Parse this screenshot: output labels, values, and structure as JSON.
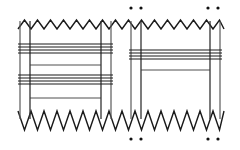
{
  "figure": {
    "background_color": "#ffffff",
    "ink_color": "#1a1a1a",
    "rule_color": "#5a5a5a",
    "width": 240,
    "height": 150
  },
  "chart_data": {
    "type": "diagram",
    "description": "Two rectangular panels with sawtooth (zigzag) torn top and bottom edges, vertical selvedge rules, grouped horizontal weft lines, and four pairs of registration dots above and below the right panel.",
    "xlabel": "",
    "ylabel": "",
    "grid": false,
    "legend": "none",
    "panels": [
      {
        "name": "left-panel",
        "x_start": 18,
        "x_end": 113,
        "y_top": 27,
        "y_bottom": 113,
        "vertical_rules": [
          20,
          30,
          101,
          111
        ],
        "horizontal_line_groups": [
          {
            "name": "group-1",
            "y_values": [
              44,
              47,
              50,
              53
            ],
            "x_start": 18,
            "x_end": 113
          },
          {
            "name": "group-2",
            "y_values": [
              65
            ],
            "x_start": 30,
            "x_end": 101
          },
          {
            "name": "group-3",
            "y_values": [
              75,
              78,
              81,
              84
            ],
            "x_start": 18,
            "x_end": 113
          },
          {
            "name": "group-4",
            "y_values": [
              98
            ],
            "x_start": 30,
            "x_end": 101
          }
        ]
      },
      {
        "name": "right-panel",
        "x_start": 129,
        "x_end": 222,
        "y_top": 27,
        "y_bottom": 113,
        "vertical_rules": [
          131,
          141,
          210,
          220
        ],
        "horizontal_line_groups": [
          {
            "name": "group-1",
            "y_values": [
              50,
              53,
              56,
              59
            ],
            "x_start": 129,
            "x_end": 222
          },
          {
            "name": "group-2",
            "y_values": [
              70
            ],
            "x_start": 141,
            "x_end": 210
          }
        ]
      }
    ],
    "zigzag": {
      "top_y_peak": 20,
      "top_y_valley": 29,
      "bottom_y_peak": 130,
      "bottom_y_valley": 111,
      "tooth_width": 13,
      "x_start": 18,
      "x_end": 224
    },
    "registration_dots": {
      "radius": 1.6,
      "top": [
        {
          "x": 131,
          "y": 8
        },
        {
          "x": 141,
          "y": 8
        },
        {
          "x": 208,
          "y": 8
        },
        {
          "x": 218,
          "y": 8
        }
      ],
      "bottom": [
        {
          "x": 131,
          "y": 139
        },
        {
          "x": 141,
          "y": 139
        },
        {
          "x": 208,
          "y": 139
        },
        {
          "x": 218,
          "y": 139
        }
      ]
    }
  }
}
